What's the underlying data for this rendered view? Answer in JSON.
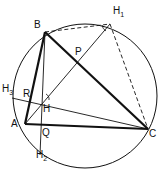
{
  "diagram": {
    "points": {
      "A": {
        "label": "A",
        "x": 25,
        "y": 124
      },
      "B": {
        "label": "B",
        "x": 45,
        "y": 32
      },
      "C": {
        "label": "C",
        "x": 148,
        "y": 129
      },
      "H": {
        "label": "H",
        "x": 43,
        "y": 101
      },
      "H1": {
        "label": "H",
        "sub": "1",
        "x": 110,
        "y": 24
      },
      "H2": {
        "label": "H",
        "sub": "2",
        "x": 40,
        "y": 155
      },
      "H3": {
        "label": "H",
        "sub": "3",
        "x": 10,
        "y": 93
      },
      "P": {
        "label": "P",
        "x": 78,
        "y": 64
      },
      "Q": {
        "label": "Q",
        "x": 43,
        "y": 125
      },
      "R": {
        "label": "R",
        "x": 33,
        "y": 92
      }
    },
    "circle": {
      "cx": 84,
      "cy": 96,
      "r": 72
    }
  }
}
